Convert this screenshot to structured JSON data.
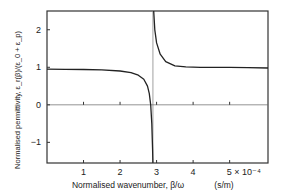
{
  "chart_data": {
    "type": "line",
    "title": "",
    "xlabel": "Normalised wavenumber, β/ω",
    "xunit": "(s/m)",
    "ylabel": "Normalised permittivity, ε_r(β)/(ε_0 + ε_p)",
    "xlim": [
      0,
      6.05
    ],
    "ylim": [
      -1.55,
      2.5
    ],
    "x_scale_note": "× 10⁻⁴",
    "xticks": [
      1,
      2,
      3,
      4,
      5
    ],
    "xtick_labels": [
      "1",
      "2",
      "3",
      "4",
      "5 × 10⁻⁴"
    ],
    "yticks": [
      2,
      1,
      0,
      -1
    ],
    "ytick_labels": [
      "2",
      "1",
      "0",
      "−1"
    ],
    "grid": false,
    "zero_line": true,
    "asymptote_x": 2.9,
    "series": [
      {
        "name": "left-branch",
        "x": [
          0.0,
          0.5,
          1.0,
          1.5,
          2.0,
          2.3,
          2.5,
          2.65,
          2.75,
          2.8,
          2.84,
          2.87,
          2.89,
          2.9
        ],
        "y": [
          0.95,
          0.945,
          0.94,
          0.93,
          0.9,
          0.86,
          0.79,
          0.68,
          0.5,
          0.3,
          0.0,
          -0.5,
          -1.2,
          -1.55
        ]
      },
      {
        "name": "right-branch",
        "x": [
          2.92,
          2.95,
          3.0,
          3.1,
          3.25,
          3.5,
          3.8,
          4.2,
          4.6,
          5.0,
          5.5,
          6.05
        ],
        "y": [
          2.5,
          2.0,
          1.65,
          1.35,
          1.15,
          1.04,
          1.01,
          1.0,
          1.0,
          1.0,
          0.99,
          0.98
        ]
      }
    ]
  }
}
